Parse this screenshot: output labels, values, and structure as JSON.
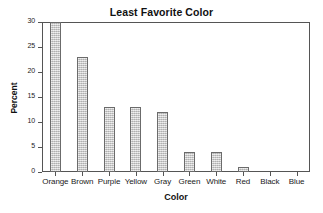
{
  "chart_data": {
    "type": "bar",
    "title": "Least Favorite Color",
    "xlabel": "Color",
    "ylabel": "Percent",
    "categories": [
      "Orange",
      "Brown",
      "Purple",
      "Yellow",
      "Gray",
      "Green",
      "White",
      "Red",
      "Black",
      "Blue"
    ],
    "values": [
      30,
      23,
      13,
      13,
      12,
      4,
      4,
      1,
      0,
      0
    ],
    "ylim": [
      0,
      30
    ],
    "yticks": [
      0,
      5,
      10,
      15,
      20,
      25,
      30
    ],
    "ytick_labels": [
      "0",
      "5",
      "10",
      "15",
      "20",
      "25",
      "30"
    ],
    "grid": false,
    "legend": "none",
    "bar_fill": "#c9c9c9",
    "bar_edge": "#6b6b6b",
    "frame_color": "#555555",
    "background": "#ffffff"
  }
}
